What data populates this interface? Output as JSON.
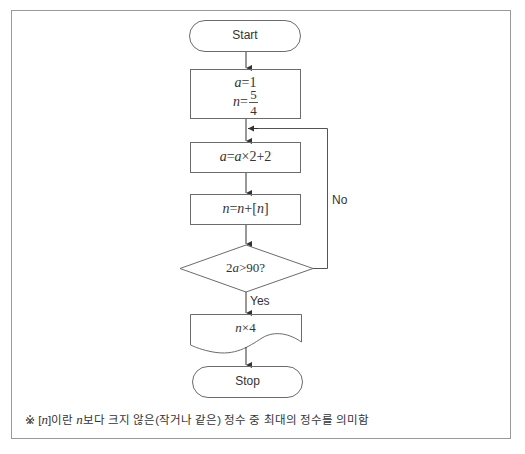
{
  "flowchart": {
    "start_label": "Start",
    "stop_label": "Stop",
    "init": {
      "line1_var": "a",
      "line1_rest": "=1",
      "line2_var": "n",
      "line2_eq": "=",
      "line2_num": "5",
      "line2_den": "4"
    },
    "step1": {
      "lhs": "a",
      "eq": "=",
      "var": "a",
      "rest": "×2+2"
    },
    "step2": {
      "lhs": "n",
      "eq": "=",
      "var": "n",
      "plus": "+[",
      "inner": "n",
      "close": "]"
    },
    "decision": {
      "coef": "2",
      "var": "a",
      "rest": ">90?"
    },
    "yes_label": "Yes",
    "no_label": "No",
    "output": {
      "var": "n",
      "rest": "×4"
    }
  },
  "footnote": {
    "prefix": "※ [",
    "var1": "n",
    "mid": "]이란 ",
    "var2": "n",
    "suffix": "보다 크지 않은(작거나 같은) 정수 중 최대의 정수를 의미함"
  },
  "colors": {
    "stroke": "#6b6b6b",
    "frame": "#9a9a9a",
    "text": "#333333"
  }
}
